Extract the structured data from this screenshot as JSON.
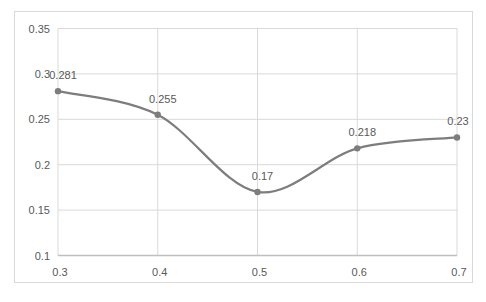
{
  "window": {
    "background": "#ffffff"
  },
  "chart_data": {
    "type": "line",
    "smooth": true,
    "title": "",
    "xlabel": "",
    "ylabel": "",
    "legend": "none",
    "grid": true,
    "x": [
      0.3,
      0.4,
      0.5,
      0.6,
      0.7
    ],
    "values": [
      0.281,
      0.255,
      0.17,
      0.218,
      0.23
    ],
    "point_labels": [
      "0.281",
      "0.255",
      "0.17",
      "0.218",
      "0.23"
    ],
    "x_ticks": [
      0.3,
      0.4,
      0.5,
      0.6,
      0.7
    ],
    "x_tick_labels": [
      "0.3",
      "0.4",
      "0.5",
      "0.6",
      "0.7"
    ],
    "y_ticks": [
      0.35,
      0.3,
      0.25,
      0.2,
      0.15,
      0.1
    ],
    "y_tick_labels": [
      "0.35",
      "0.3",
      "0.25",
      "0.2",
      "0.15",
      "0.1"
    ],
    "xlim": [
      0.3,
      0.7
    ],
    "ylim": [
      0.1,
      0.35
    ],
    "colors": {
      "line": "#7d7d7d",
      "marker": "#7d7d7d",
      "data_label": "#595959",
      "tick_label": "#595959",
      "gridline": "#d9d9d9",
      "axis_line": "#bfbfbf",
      "chart_border": "#d9d9d9",
      "background": "#ffffff"
    }
  }
}
